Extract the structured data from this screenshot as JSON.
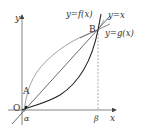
{
  "diagram": {
    "axes": {
      "x_label": "x",
      "y_label": "y",
      "origin_label": "O"
    },
    "points": {
      "A": "A",
      "B": "B"
    },
    "ticks": {
      "alpha": "α",
      "beta": "β"
    },
    "curves": {
      "f": "y=f(x)",
      "identity": "y=x",
      "g": "y=g(x)"
    },
    "colors": {
      "axis": "#555555",
      "curve_f": "#888888",
      "curve_g": "#222222",
      "line": "#444444",
      "dashed": "#777777"
    }
  }
}
